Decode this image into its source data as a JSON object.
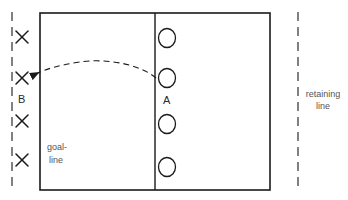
{
  "diagram": {
    "type": "field-drill-diagram",
    "colors": {
      "stroke": "#1a1a1a",
      "text": "#4a4a4a",
      "background": "#ffffff"
    },
    "field": {
      "x": 40,
      "y": 13,
      "width": 230,
      "height": 177,
      "center_line_x": 155
    },
    "team_a": {
      "label": "A",
      "marker": "circle",
      "players": [
        {
          "x": 167,
          "y": 38
        },
        {
          "x": 167,
          "y": 78
        },
        {
          "x": 167,
          "y": 124
        },
        {
          "x": 167,
          "y": 167
        }
      ]
    },
    "team_b": {
      "label": "B",
      "marker": "cross",
      "players": [
        {
          "x": 22,
          "y": 37
        },
        {
          "x": 22,
          "y": 78
        },
        {
          "x": 22,
          "y": 121
        },
        {
          "x": 22,
          "y": 160
        }
      ]
    },
    "pass_arrow": {
      "style": "dashed",
      "from": {
        "x": 156,
        "y": 78
      },
      "to": {
        "x": 36,
        "y": 73
      },
      "arrowhead": "filled"
    },
    "labels": {
      "goal_line_1": "goal-",
      "goal_line_2": "line",
      "retaining_line_1": "retaining",
      "retaining_line_2": "line",
      "team_a": "A",
      "team_b": "B"
    },
    "dashed_lines": [
      {
        "name": "left-boundary",
        "x": 12,
        "y1": 12,
        "y2": 192
      },
      {
        "name": "retaining-line",
        "x": 298,
        "y1": 12,
        "y2": 192
      }
    ]
  }
}
